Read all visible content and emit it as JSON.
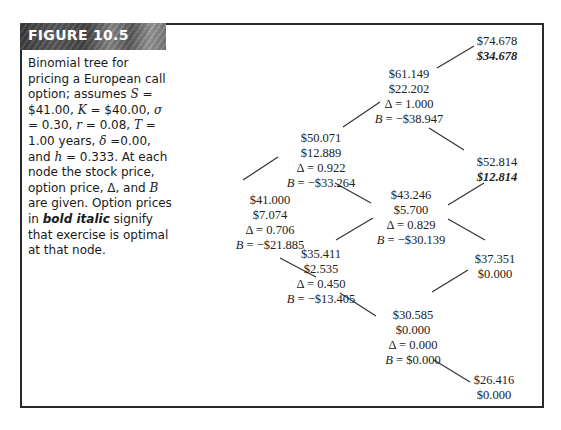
{
  "figure": {
    "label": "FIGURE 10.5",
    "caption_parts": {
      "p1": "Binomial tree for pricing a European call option; assumes ",
      "S": "S",
      "p2": " = $41.00, ",
      "K": "K",
      "p3": " = $40.00, ",
      "sigma": "σ",
      "p4": " = 0.30, ",
      "r": "r",
      "p5": " = 0.08, ",
      "T": "T",
      "p6": " = 1.00 years, ",
      "delta": "δ",
      "p7": " =0.00, and ",
      "h": "h",
      "p8": " = 0.333. At each node the stock price, option price, Δ, and ",
      "B": "B",
      "p9": " are given. Option prices in ",
      "bold_italic": "bold italic",
      "p10": " signify that exercise is optimal at that node."
    }
  },
  "parameters": {
    "S": "$41.00",
    "K": "$40.00",
    "sigma": "0.30",
    "r": "0.08",
    "T": "1.00",
    "delta": "0.00",
    "h": "0.333"
  },
  "tree": {
    "n0": {
      "stock": "$41.000",
      "option": "$7.074",
      "delta": "Δ = 0.706",
      "b_label": "B",
      "b_value": " = −$21.885"
    },
    "nu": {
      "stock": "$50.071",
      "option": "$12.889",
      "delta": "Δ = 0.922",
      "b_label": "B",
      "b_value": " = −$33.264"
    },
    "nd": {
      "stock": "$35.411",
      "option": "$2.535",
      "delta": "Δ = 0.450",
      "b_label": "B",
      "b_value": " = −$13.405"
    },
    "nuu": {
      "stock": "$61.149",
      "option": "$22.202",
      "delta": "Δ = 1.000",
      "b_label": "B",
      "b_value": " = −$38.947"
    },
    "nud": {
      "stock": "$43.246",
      "option": "$5.700",
      "delta": "Δ = 0.829",
      "b_label": "B",
      "b_value": " = −$30.139"
    },
    "ndd": {
      "stock": "$30.585",
      "option": "$0.000",
      "delta": "Δ = 0.000",
      "b_label": "B",
      "b_value": " = $0.000"
    },
    "nuuu": {
      "stock": "$74.678",
      "option": "$34.678",
      "exercise": true
    },
    "nuud": {
      "stock": "$52.814",
      "option": "$12.814",
      "exercise": true
    },
    "nudd": {
      "stock": "$37.351",
      "option": "$0.000"
    },
    "nddd": {
      "stock": "$26.416",
      "option": "$0.000"
    }
  }
}
